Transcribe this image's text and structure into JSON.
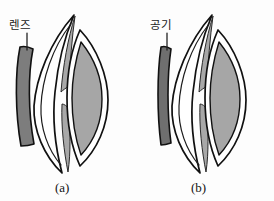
{
  "figure": {
    "background_color": "#fdfdfd",
    "panels": [
      {
        "id": "a",
        "caption": "(a)",
        "label": "렌즈",
        "label_meaning": "lens",
        "front_element": {
          "name": "corrective-lens",
          "shape": "thick curved crescent",
          "fill_color": "#7d7d7d",
          "outline_color": "#111111"
        }
      },
      {
        "id": "b",
        "caption": "(b)",
        "label": "공기",
        "label_meaning": "air",
        "front_element": {
          "name": "air-layer",
          "shape": "thin straight bar",
          "fill_color": "#6f6f6f",
          "outline_color": "#111111"
        }
      }
    ],
    "shared_parts": {
      "cornea_outline_color": "#111111",
      "cornea_fill_color": "#ffffff",
      "iris_fill_color": "#a8a8a8",
      "crystalline_lens_fill_color": "#a6a6a6",
      "crystalline_lens_outline_color": "#111111",
      "interior_fill_color": "#ffffff"
    },
    "colors": {
      "ink": "#111111",
      "dark_gray": "#7d7d7d",
      "mid_gray": "#a8a8a8",
      "paper": "#fdfdfd"
    }
  }
}
